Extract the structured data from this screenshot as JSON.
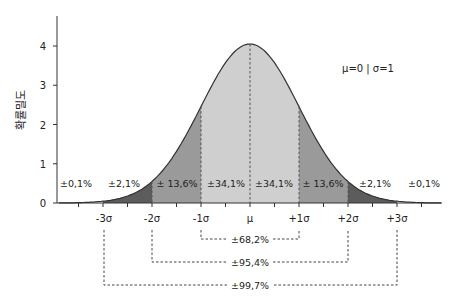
{
  "chart_data": {
    "type": "area",
    "title": "",
    "annotation": "μ=0 | σ=1",
    "xlabel": "",
    "ylabel": "확률밀도",
    "ylim": [
      0,
      4.6
    ],
    "yticks": [
      0,
      1,
      2,
      3,
      4
    ],
    "xticks": [
      "-3σ",
      "-2σ",
      "-1σ",
      "μ",
      "+1σ",
      "+2σ",
      "+3σ"
    ],
    "grid": false,
    "curve": {
      "peak_value": 4.05,
      "shape": "normal distribution"
    },
    "regions": [
      {
        "range": [
          "-∞",
          "-3σ"
        ],
        "label": "±0,1%",
        "shade": "none"
      },
      {
        "range": [
          "-3σ",
          "-2σ"
        ],
        "label": "±2,1%",
        "shade": "#5c5c5c"
      },
      {
        "range": [
          "-2σ",
          "-1σ"
        ],
        "label": "± 13,6%",
        "shade": "#9a9a9a"
      },
      {
        "range": [
          "-1σ",
          "μ"
        ],
        "label": "±34,1%",
        "shade": "#cfcfcf"
      },
      {
        "range": [
          "μ",
          "+1σ"
        ],
        "label": "±34,1%",
        "shade": "#cfcfcf"
      },
      {
        "range": [
          "+1σ",
          "+2σ"
        ],
        "label": "± 13,6%",
        "shade": "#9a9a9a"
      },
      {
        "range": [
          "+2σ",
          "+3σ"
        ],
        "label": "±2,1%",
        "shade": "#5c5c5c"
      },
      {
        "range": [
          "+3σ",
          "+∞"
        ],
        "label": "±0,1%",
        "shade": "none"
      }
    ],
    "brackets": [
      {
        "range": [
          "-1σ",
          "+1σ"
        ],
        "label": "±68,2%"
      },
      {
        "range": [
          "-2σ",
          "+2σ"
        ],
        "label": "±95,4%"
      },
      {
        "range": [
          "-3σ",
          "+3σ"
        ],
        "label": "±99,7%"
      }
    ]
  },
  "labels": {
    "param": "μ=0 | σ=1",
    "ylabel": "확률밀도",
    "yticks": [
      "0",
      "1",
      "2",
      "3",
      "4"
    ],
    "xticks": [
      "-3σ",
      "-2σ",
      "-1σ",
      "μ",
      "+1σ",
      "+2σ",
      "+3σ"
    ],
    "regions": [
      "±0,1%",
      "±2,1%",
      "± 13,6%",
      "±34,1%",
      "±34,1%",
      "± 13,6%",
      "±2,1%",
      "±0,1%"
    ],
    "brackets": [
      "±68,2%",
      "±95,4%",
      "±99,7%"
    ]
  }
}
